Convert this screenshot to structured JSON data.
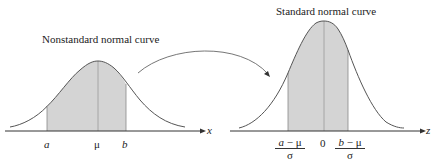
{
  "left_panel": {
    "title": "Nonstandard normal curve",
    "axis_label": "x",
    "ticks": {
      "a": "a",
      "mu": "μ",
      "b": "b"
    }
  },
  "right_panel": {
    "title": "Standard normal curve",
    "axis_label": "z",
    "ticks": {
      "zero": "0",
      "left_num_var": "a",
      "left_num_rest": " − μ",
      "left_den": "σ",
      "right_num_var": "b",
      "right_num_rest": " − μ",
      "right_den": "σ"
    }
  },
  "colors": {
    "shade": "#d4d4d4",
    "curve": "#555555",
    "axis": "#333333"
  }
}
